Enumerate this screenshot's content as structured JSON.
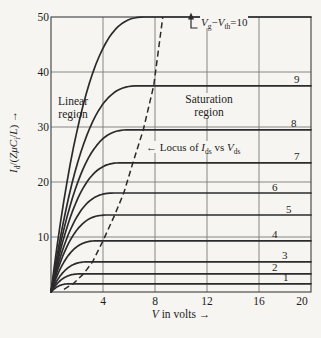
{
  "figure": {
    "background": "#f6f5f1",
    "ink": "#2b2b2b",
    "grid_color": "#7a7a78",
    "border_color": "#3c3c3c",
    "text_color": "#1d1d1d"
  },
  "axes": {
    "x": {
      "range": [
        0,
        20
      ],
      "ticks": [
        "4",
        "8",
        "12",
        "16",
        "20"
      ],
      "tick_values": [
        4,
        8,
        12,
        16,
        20
      ],
      "title_segments": [
        {
          "t": "V",
          "st": "i"
        },
        {
          "t": " in volts ",
          "st": "p"
        },
        {
          "t": "→",
          "st": "p"
        }
      ]
    },
    "y": {
      "range": [
        0,
        50
      ],
      "ticks": [
        "10",
        "20",
        "30",
        "40",
        "50"
      ],
      "tick_values": [
        10,
        20,
        30,
        40,
        50
      ],
      "title_segments": [
        {
          "t": "I",
          "st": "i"
        },
        {
          "t": "d",
          "st": "s"
        },
        {
          "t": "/(",
          "st": "p"
        },
        {
          "t": "ZμC",
          "st": "i"
        },
        {
          "t": "i",
          "st": "s"
        },
        {
          "t": "/",
          "st": "p"
        },
        {
          "t": "L",
          "st": "i"
        },
        {
          "t": ") ",
          "st": "p"
        },
        {
          "t": "→",
          "st": "p"
        }
      ]
    }
  },
  "annotations": {
    "linear_region": {
      "line1": "Linear",
      "line2": "region"
    },
    "saturation_region": {
      "line1": "Saturation",
      "line2": "region"
    },
    "locus_arrow": "←",
    "locus_segments": [
      {
        "t": " Locus of ",
        "st": "p"
      },
      {
        "t": "I",
        "st": "i"
      },
      {
        "t": "ds",
        "st": "s"
      },
      {
        "t": " vs ",
        "st": "p"
      },
      {
        "t": "V",
        "st": "i"
      },
      {
        "t": "ds",
        "st": "s"
      }
    ],
    "top_label_segments": [
      {
        "t": "V",
        "st": "i"
      },
      {
        "t": "g",
        "st": "s"
      },
      {
        "t": "−",
        "st": "p"
      },
      {
        "t": "V",
        "st": "i"
      },
      {
        "t": "th",
        "st": "s"
      },
      {
        "t": "=10",
        "st": "p"
      }
    ]
  },
  "chart_data": {
    "type": "line",
    "xlabel": "V in volts",
    "ylabel": "Id/(ZμCi/L)",
    "xlim": [
      0,
      20
    ],
    "ylim": [
      0,
      50
    ],
    "grid": true,
    "x_gridlines": [
      4,
      8,
      12,
      16
    ],
    "y_gridlines": [
      10,
      20,
      30,
      40
    ],
    "curves": [
      {
        "label": "1",
        "vg_minus_vth": 1,
        "i_sat": 1.5,
        "v_knee": 1.6
      },
      {
        "label": "2",
        "vg_minus_vth": 2,
        "i_sat": 3.3,
        "v_knee": 2.4
      },
      {
        "label": "3",
        "vg_minus_vth": 3,
        "i_sat": 5.5,
        "v_knee": 3.0
      },
      {
        "label": "4",
        "vg_minus_vth": 4,
        "i_sat": 9.3,
        "v_knee": 3.7
      },
      {
        "label": "5",
        "vg_minus_vth": 5,
        "i_sat": 14.0,
        "v_knee": 4.5
      },
      {
        "label": "6",
        "vg_minus_vth": 6,
        "i_sat": 18.0,
        "v_knee": 5.0
      },
      {
        "label": "7",
        "vg_minus_vth": 7,
        "i_sat": 23.5,
        "v_knee": 5.6
      },
      {
        "label": "8",
        "vg_minus_vth": 8,
        "i_sat": 29.5,
        "v_knee": 6.2
      },
      {
        "label": "9",
        "vg_minus_vth": 9,
        "i_sat": 37.5,
        "v_knee": 6.9
      },
      {
        "label": "10",
        "vg_minus_vth": 10,
        "i_sat": 50.0,
        "v_knee": 7.4
      }
    ],
    "locus_points": [
      [
        1.0,
        0.5
      ],
      [
        1.7,
        1.5
      ],
      [
        2.5,
        3.3
      ],
      [
        3.2,
        5.5
      ],
      [
        4.0,
        9.3
      ],
      [
        4.9,
        14.0
      ],
      [
        5.6,
        18.0
      ],
      [
        6.3,
        23.5
      ],
      [
        7.1,
        29.5
      ],
      [
        7.9,
        37.5
      ],
      [
        8.6,
        50.0
      ]
    ]
  }
}
